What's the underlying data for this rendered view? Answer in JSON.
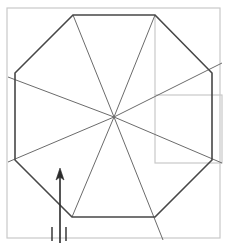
{
  "figure": {
    "canvas": {
      "width": 227,
      "height": 248,
      "background": "#ffffff"
    },
    "colors": {
      "outline": "#474747",
      "spoke": "#6b6b6b",
      "guide": "#c9c9c9",
      "arrow": "#2b2b2b",
      "background": "#ffffff"
    },
    "stroke_widths": {
      "outline": 1.6,
      "spoke": 1.0,
      "guide": 1.2,
      "arrow": 1.6,
      "tick": 1.4
    },
    "octagon": {
      "name": "octagon-outline",
      "center": {
        "x": 114,
        "y": 117
      },
      "vertices": [
        {
          "index": 0,
          "x": 73,
          "y": 15
        },
        {
          "index": 1,
          "x": 155,
          "y": 15
        },
        {
          "index": 2,
          "x": 212,
          "y": 73
        },
        {
          "index": 3,
          "x": 212,
          "y": 160
        },
        {
          "index": 4,
          "x": 155,
          "y": 217
        },
        {
          "index": 5,
          "x": 72,
          "y": 217
        },
        {
          "index": 6,
          "x": 15,
          "y": 160
        },
        {
          "index": 7,
          "x": 15,
          "y": 73
        }
      ],
      "points_attr": "73,15 155,15 212,73 212,160 155,217 72,217 15,160 15,73"
    },
    "spokes": {
      "name": "center-spokes",
      "count": 8,
      "lines": [
        {
          "index": 0,
          "label": "spoke-to-vertex-0",
          "x1": 114,
          "y1": 117,
          "x2": 73,
          "y2": 15
        },
        {
          "index": 1,
          "label": "spoke-to-vertex-1",
          "x1": 114,
          "y1": 117,
          "x2": 155,
          "y2": 15
        },
        {
          "index": 2,
          "label": "spoke-to-vertex-2",
          "x1": 114,
          "y1": 117,
          "x2": 222,
          "y2": 63
        },
        {
          "index": 3,
          "label": "spoke-to-vertex-3",
          "x1": 114,
          "y1": 117,
          "x2": 222,
          "y2": 163
        },
        {
          "index": 4,
          "label": "spoke-to-vertex-4",
          "x1": 114,
          "y1": 117,
          "x2": 163,
          "y2": 240
        },
        {
          "index": 5,
          "label": "spoke-to-vertex-5",
          "x1": 114,
          "y1": 117,
          "x2": 72,
          "y2": 217
        },
        {
          "index": 6,
          "label": "spoke-to-vertex-6",
          "x1": 114,
          "y1": 117,
          "x2": 8,
          "y2": 162
        },
        {
          "index": 7,
          "label": "spoke-to-vertex-7",
          "x1": 114,
          "y1": 117,
          "x2": 8,
          "y2": 77
        }
      ]
    },
    "guides": {
      "name": "guide-rectangles",
      "rects": [
        {
          "index": 0,
          "label": "outer-guide-rect",
          "x": 7,
          "y": 8,
          "width": 213,
          "height": 230
        },
        {
          "index": 1,
          "label": "right-guide-rect",
          "x": 155,
          "y": 95,
          "width": 67,
          "height": 68
        }
      ],
      "lines": [
        {
          "index": 0,
          "label": "guide-vertical-top-right",
          "x1": 155,
          "y1": 15,
          "x2": 155,
          "y2": 95
        }
      ]
    },
    "arrow": {
      "name": "direction-arrow",
      "label": "north-arrow",
      "shaft": {
        "x1": 60,
        "y1": 243,
        "x2": 60,
        "y2": 172
      },
      "head": {
        "points_attr": "60,168 56,180 60,177 64,180",
        "tip_x": 60,
        "tip_y": 168
      }
    },
    "ticks": {
      "name": "scale-ticks",
      "marks": [
        {
          "index": 0,
          "label": "tick-left",
          "x1": 52,
          "y1": 227,
          "x2": 52,
          "y2": 241
        },
        {
          "index": 1,
          "label": "tick-right",
          "x1": 66,
          "y1": 227,
          "x2": 66,
          "y2": 241
        }
      ]
    }
  }
}
